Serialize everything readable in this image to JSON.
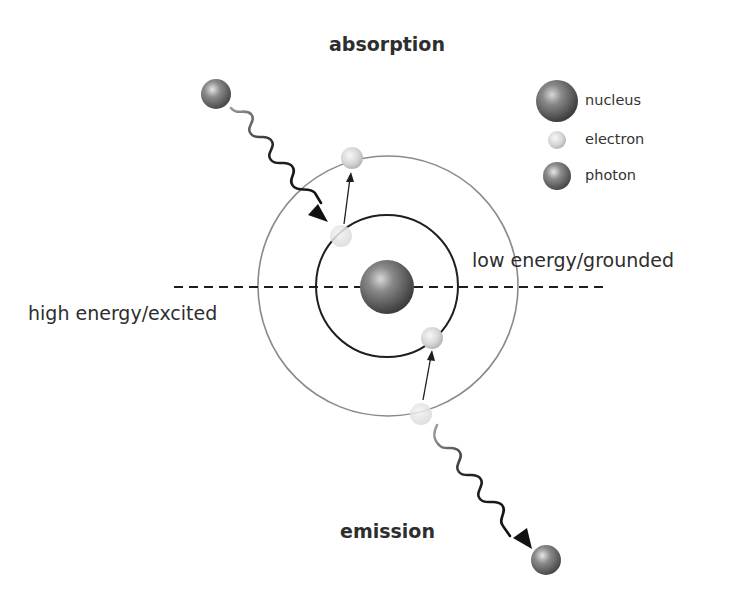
{
  "diagram": {
    "title_top": "absorption",
    "title_bottom": "emission",
    "label_right": "low energy/grounded",
    "label_left": "high energy/excited"
  },
  "legend": {
    "items": [
      {
        "label": "nucleus",
        "icon": "nucleus-sphere"
      },
      {
        "label": "electron",
        "icon": "electron-sphere"
      },
      {
        "label": "photon",
        "icon": "photon-sphere"
      }
    ]
  },
  "colors": {
    "outer_orbit": "#8a8a8a",
    "inner_orbit": "#1e1e1e",
    "nucleus": "#6e6e6e",
    "electron": "#d9d9d9",
    "photon": "#7a7a7a",
    "wave": "#1a1a1a"
  }
}
